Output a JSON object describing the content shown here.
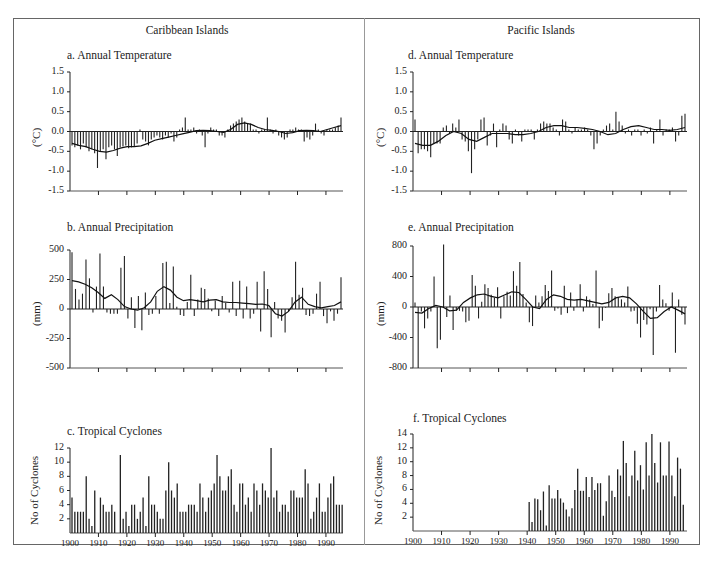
{
  "figure": {
    "regions": [
      {
        "title": "Caribbean Islands"
      },
      {
        "title": "Pacific Islands"
      }
    ],
    "panels": {
      "a": {
        "title": "a. Annual Temperature",
        "ylabel": "(°C)",
        "yticks": [
          "1.5",
          "1.0",
          "0.5",
          "0.0",
          "-0.5",
          "-1.0",
          "-1.5"
        ]
      },
      "b": {
        "title": "b. Annual Precipitation",
        "ylabel": "(mm)",
        "yticks": [
          "500",
          "250",
          "0",
          "-250",
          "-500"
        ]
      },
      "c": {
        "title": "c. Tropical Cyclones",
        "ylabel": "No of Cyclones",
        "yticks": [
          "12",
          "10",
          "8",
          "6",
          "4",
          "2"
        ],
        "xticks": [
          "1900",
          "1910",
          "1920",
          "1930",
          "1940",
          "1950",
          "1960",
          "1970",
          "1980",
          "1990"
        ]
      },
      "d": {
        "title": "d. Annual Temperature",
        "ylabel": "(°C)",
        "yticks": [
          "1.5",
          "1.0",
          "0.5",
          "0.0",
          "-0.5",
          "-1.0",
          "-1.5"
        ]
      },
      "e": {
        "title": "e. Annual Precipitation",
        "ylabel": "(mm)",
        "yticks": [
          "800",
          "400",
          "0",
          "-400",
          "-800"
        ]
      },
      "f": {
        "title": "f. Tropical Cyclones",
        "ylabel": "No of Cyclones",
        "yticks": [
          "14",
          "12",
          "10",
          "8",
          "6",
          "4",
          "2"
        ],
        "xticks": [
          "1900",
          "1910",
          "1920",
          "1930",
          "1940",
          "1950",
          "1960",
          "1970",
          "1980",
          "1990"
        ]
      }
    }
  },
  "chart_data": [
    {
      "id": "a",
      "type": "bar",
      "title": "a. Annual Temperature",
      "region": "Caribbean Islands",
      "xlabel": "",
      "ylabel": "(°C)",
      "ylim": [
        -1.5,
        1.5
      ],
      "x_start": 1900,
      "x_end": 1996,
      "values": [
        -0.35,
        -0.4,
        -0.35,
        -0.45,
        -0.3,
        -0.4,
        -0.5,
        -0.45,
        -0.55,
        -0.92,
        -0.5,
        -0.45,
        -0.7,
        -0.4,
        -0.35,
        -0.45,
        -0.62,
        -0.4,
        -0.38,
        -0.35,
        -0.42,
        -0.4,
        -0.38,
        -0.3,
        0.05,
        -0.2,
        -0.25,
        -0.35,
        -0.2,
        -0.15,
        -0.1,
        -0.15,
        -0.2,
        -0.1,
        -0.15,
        -0.05,
        -0.25,
        -0.15,
        0.05,
        0.1,
        0.35,
        0.05,
        0.05,
        0.1,
        -0.05,
        0.05,
        -0.1,
        -0.4,
        -0.05,
        0.1,
        0.05,
        0.05,
        -0.1,
        -0.1,
        -0.15,
        0.05,
        0.15,
        0.2,
        0.25,
        0.3,
        0.35,
        0.25,
        0.2,
        0.2,
        0.05,
        0.05,
        -0.05,
        0.05,
        0.05,
        0.35,
        0.05,
        -0.05,
        0.05,
        -0.1,
        -0.15,
        -0.2,
        -0.15,
        0.05,
        0.05,
        0.1,
        0.05,
        0.05,
        -0.25,
        -0.15,
        -0.2,
        -0.1,
        0.2,
        0.05,
        -0.05,
        -0.1,
        0.05,
        0.05,
        0.05,
        0.1,
        0.15,
        0.35
      ],
      "smoothed": [
        -0.3,
        -0.35,
        -0.38,
        -0.45,
        -0.5,
        -0.52,
        -0.48,
        -0.42,
        -0.38,
        -0.38,
        -0.36,
        -0.3,
        -0.22,
        -0.18,
        -0.14,
        -0.1,
        -0.06,
        -0.02,
        0.02,
        0.03,
        0.02,
        0.0,
        -0.02,
        0.05,
        0.18,
        0.22,
        0.18,
        0.1,
        0.05,
        0.03,
        0.0,
        -0.05,
        -0.03,
        0.02,
        0.03,
        0.02,
        0.0,
        0.05,
        0.1,
        0.15
      ]
    },
    {
      "id": "b",
      "type": "bar",
      "title": "b. Annual Precipitation",
      "region": "Caribbean Islands",
      "xlabel": "",
      "ylabel": "(mm)",
      "ylim": [
        -500,
        500
      ],
      "x_start": 1900,
      "x_end": 1996,
      "values": [
        480,
        170,
        80,
        130,
        420,
        260,
        -30,
        190,
        470,
        190,
        -30,
        -40,
        -40,
        -40,
        350,
        450,
        -80,
        100,
        -160,
        110,
        -180,
        140,
        -50,
        -40,
        110,
        -40,
        390,
        400,
        50,
        360,
        20,
        -50,
        -60,
        60,
        290,
        -60,
        80,
        180,
        170,
        90,
        -20,
        70,
        -60,
        110,
        50,
        -30,
        230,
        -60,
        240,
        -80,
        190,
        -80,
        -40,
        230,
        -190,
        320,
        170,
        -240,
        60,
        -80,
        -100,
        -200,
        -20,
        100,
        400,
        120,
        180,
        -50,
        -60,
        -40,
        130,
        230,
        -60,
        -120,
        -20,
        -100,
        -40,
        270
      ],
      "smoothed": [
        240,
        230,
        210,
        180,
        140,
        90,
        120,
        80,
        20,
        0,
        -10,
        10,
        60,
        150,
        190,
        160,
        100,
        70,
        80,
        70,
        60,
        75,
        80,
        60,
        55,
        55,
        50,
        45,
        40,
        42,
        30,
        -40,
        -60,
        -20,
        60,
        100,
        40,
        20,
        10,
        20,
        30,
        60
      ]
    },
    {
      "id": "c",
      "type": "bar",
      "title": "c. Tropical Cyclones",
      "region": "Caribbean Islands",
      "xlabel": "",
      "ylabel": "No of Cyclones",
      "ylim": [
        0,
        12
      ],
      "categories": [
        1900,
        1901,
        1902,
        1903,
        1904,
        1905,
        1906,
        1907,
        1908,
        1909,
        1910,
        1911,
        1912,
        1913,
        1914,
        1915,
        1916,
        1917,
        1918,
        1919,
        1920,
        1921,
        1922,
        1923,
        1924,
        1925,
        1926,
        1927,
        1928,
        1929,
        1930,
        1931,
        1932,
        1933,
        1934,
        1935,
        1936,
        1937,
        1938,
        1939,
        1940,
        1941,
        1942,
        1943,
        1944,
        1945,
        1946,
        1947,
        1948,
        1949,
        1950,
        1951,
        1952,
        1953,
        1954,
        1955,
        1956,
        1957,
        1958,
        1959,
        1960,
        1961,
        1962,
        1963,
        1964,
        1965,
        1966,
        1967,
        1968,
        1969,
        1970,
        1971,
        1972,
        1973,
        1974,
        1975,
        1976,
        1977,
        1978,
        1979,
        1980,
        1981,
        1982,
        1983,
        1984,
        1985,
        1986,
        1987,
        1988,
        1989,
        1990,
        1991,
        1992
      ],
      "values": [
        5,
        3,
        3,
        3,
        3,
        8,
        2,
        1,
        6,
        0,
        5,
        4,
        3,
        3,
        4,
        3,
        0,
        11,
        2,
        3,
        1,
        4,
        4,
        2,
        3,
        5,
        1,
        8,
        4,
        4,
        3,
        2,
        2,
        6,
        10,
        6,
        5,
        7,
        3,
        3,
        3,
        4,
        4,
        4,
        3,
        7,
        5,
        3,
        5,
        6,
        7,
        11,
        8,
        6,
        6,
        8,
        9,
        4,
        3,
        7,
        7,
        4,
        5,
        3,
        7,
        6,
        4,
        7,
        6,
        5,
        12,
        5,
        6,
        3,
        4,
        4,
        3,
        6,
        6,
        5,
        5,
        5,
        9,
        7,
        2,
        3,
        5,
        7,
        3,
        3,
        5,
        7,
        8,
        4,
        4,
        4
      ],
      "xticks": [
        1900,
        1910,
        1920,
        1930,
        1940,
        1950,
        1960,
        1970,
        1980,
        1990
      ]
    },
    {
      "id": "d",
      "type": "bar",
      "title": "d. Annual Temperature",
      "region": "Pacific Islands",
      "xlabel": "",
      "ylabel": "(°C)",
      "ylim": [
        -1.5,
        1.5
      ],
      "x_start": 1900,
      "x_end": 1996,
      "values": [
        0.3,
        -0.55,
        -0.45,
        -0.45,
        -0.5,
        -0.65,
        -0.3,
        -0.3,
        -0.3,
        0.1,
        0.15,
        -0.05,
        0.2,
        0.1,
        0.3,
        -0.2,
        -0.25,
        -0.5,
        -1.05,
        -0.45,
        -0.2,
        0.3,
        0.35,
        -0.35,
        -0.1,
        0.2,
        -0.4,
        0.05,
        0.2,
        0.15,
        -0.2,
        -0.3,
        0.05,
        -0.1,
        -0.25,
        0.05,
        0.05,
        0.05,
        -0.2,
        0.05,
        0.2,
        0.25,
        0.2,
        0.2,
        0.1,
        0.05,
        -0.1,
        0.3,
        0.25,
        0.05,
        -0.05,
        0.1,
        0.05,
        0.05,
        0.1,
        0.05,
        -0.1,
        -0.45,
        -0.3,
        -0.1,
        0.05,
        0.15,
        0.2,
        0.05,
        0.5,
        0.25,
        0.15,
        -0.05,
        0.05,
        -0.1,
        0.05,
        0.05,
        -0.1,
        0.05,
        -0.05,
        0.1,
        -0.3,
        0.05,
        0.3,
        -0.1,
        0.05,
        0.05,
        0.1,
        -0.25,
        -0.1,
        0.4,
        0.45
      ],
      "smoothed": [
        -0.3,
        -0.35,
        -0.35,
        -0.25,
        -0.1,
        0.0,
        -0.05,
        -0.2,
        -0.25,
        -0.15,
        -0.05,
        -0.05,
        -0.05,
        -0.08,
        -0.08,
        -0.05,
        0.0,
        0.1,
        0.15,
        0.15,
        0.1,
        0.1,
        0.08,
        0.05,
        0.0,
        -0.08,
        -0.05,
        0.05,
        0.12,
        0.15,
        0.1,
        0.05,
        0.05,
        0.03,
        0.05,
        0.1
      ]
    },
    {
      "id": "e",
      "type": "bar",
      "title": "e. Annual Precipitation",
      "region": "Pacific Islands",
      "xlabel": "",
      "ylabel": "(mm)",
      "ylim": [
        -800,
        800
      ],
      "x_start": 1900,
      "x_end": 1996,
      "values": [
        60,
        -800,
        -60,
        -280,
        -150,
        -60,
        400,
        -540,
        -430,
        820,
        -130,
        150,
        -300,
        -50,
        -50,
        -60,
        -200,
        -180,
        420,
        280,
        -150,
        70,
        300,
        250,
        160,
        120,
        260,
        -150,
        140,
        200,
        150,
        470,
        280,
        590,
        170,
        60,
        -200,
        -250,
        150,
        60,
        140,
        290,
        210,
        480,
        -50,
        -20,
        -100,
        280,
        -80,
        190,
        -50,
        100,
        300,
        -60,
        140,
        100,
        40,
        480,
        -280,
        -180,
        -10,
        180,
        250,
        140,
        120,
        100,
        60,
        270,
        -60,
        -50,
        -220,
        -400,
        -170,
        -230,
        -30,
        -630,
        -60,
        290,
        100,
        50,
        -50,
        190,
        -600,
        100,
        -100,
        -230
      ],
      "smoothed": [
        -70,
        -80,
        -20,
        20,
        0,
        -50,
        -40,
        60,
        120,
        160,
        170,
        140,
        120,
        160,
        200,
        190,
        100,
        0,
        -20,
        100,
        160,
        140,
        100,
        90,
        100,
        80,
        60,
        40,
        60,
        120,
        140,
        120,
        40,
        -60,
        -150,
        -140,
        -60,
        0,
        -40,
        -90
      ]
    },
    {
      "id": "f",
      "type": "bar",
      "title": "f. Tropical Cyclones",
      "region": "Pacific Islands",
      "xlabel": "",
      "ylabel": "No of Cyclones",
      "ylim": [
        0,
        14
      ],
      "categories": [
        1940,
        1941,
        1942,
        1943,
        1944,
        1945,
        1946,
        1947,
        1948,
        1949,
        1950,
        1951,
        1952,
        1953,
        1954,
        1955,
        1956,
        1957,
        1958,
        1959,
        1960,
        1961,
        1962,
        1963,
        1964,
        1965,
        1966,
        1967,
        1968,
        1969,
        1970,
        1971,
        1972,
        1973,
        1974,
        1975,
        1976,
        1977,
        1978,
        1979,
        1980,
        1981,
        1982,
        1983,
        1984,
        1985,
        1986,
        1987,
        1988,
        1989,
        1990,
        1991,
        1992,
        1993
      ],
      "values": [
        4.2,
        1.3,
        4.7,
        4.6,
        3,
        5.7,
        0.8,
        6.6,
        4.7,
        4.7,
        5.9,
        4.7,
        4.1,
        3.1,
        2.1,
        3.3,
        5.9,
        9,
        5.8,
        5.8,
        7.8,
        4.9,
        7.8,
        5.9,
        6.9,
        6.9,
        2.2,
        4.3,
        8,
        5.8,
        4.9,
        8.9,
        8,
        13,
        9.8,
        5,
        8,
        11.6,
        7.3,
        9.5,
        6,
        12.8,
        8,
        14,
        9.8,
        7,
        12.8,
        8,
        8,
        12.9,
        8,
        5,
        10.6,
        9,
        3.8
      ],
      "xticks": [
        1900,
        1910,
        1920,
        1930,
        1940,
        1950,
        1960,
        1970,
        1980,
        1990
      ],
      "note": "No data plotted before 1940"
    }
  ]
}
